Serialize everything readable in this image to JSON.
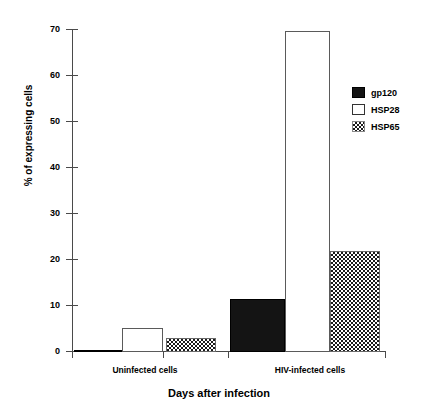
{
  "chart_data": {
    "type": "bar",
    "title": "",
    "xlabel": "Days after infection",
    "ylabel": "% of expressing cells",
    "categories": [
      "Uninfected cells",
      "HIV-infected cells"
    ],
    "series": [
      {
        "name": "gp120",
        "values": [
          0.3,
          11.3
        ],
        "fill": "solid-black",
        "color": "#141414"
      },
      {
        "name": "HSP28",
        "values": [
          5.1,
          69.5
        ],
        "fill": "empty-white",
        "color": "#ffffff"
      },
      {
        "name": "HSP65",
        "values": [
          2.8,
          21.7
        ],
        "fill": "checkerboard",
        "color": "#1a1a1a"
      }
    ],
    "ylim": [
      0,
      70
    ],
    "yticks": [
      0,
      10,
      20,
      30,
      40,
      50,
      60,
      70
    ],
    "ytick_labels": [
      "0",
      "10",
      "20",
      "30",
      "40",
      "50",
      "60",
      "70"
    ],
    "grid": false,
    "legend_position": "right"
  },
  "legend": {
    "entries": [
      {
        "label": "gp120",
        "swatch": "solid-black-swatch"
      },
      {
        "label": "HSP28",
        "swatch": "empty-white-swatch"
      },
      {
        "label": "HSP65",
        "swatch": "checkerboard-swatch"
      }
    ]
  },
  "axes": {
    "y_label": "% of expressing cells",
    "x_label": "Days after infection",
    "y_tick_labels": [
      "70",
      "60",
      "50",
      "40",
      "30",
      "20",
      "10",
      "0"
    ],
    "x_group_labels": [
      "Uninfected cells",
      "HIV-infected cells"
    ]
  }
}
